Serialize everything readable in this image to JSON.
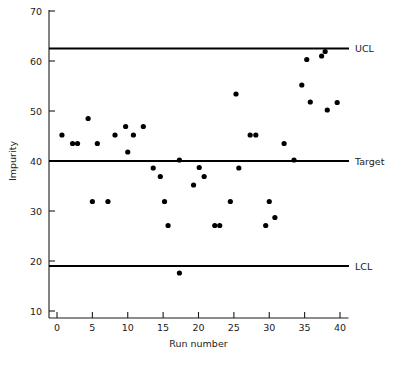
{
  "chart_data": {
    "type": "scatter",
    "title": "",
    "xlabel": "Run number",
    "ylabel": "Impurity",
    "xlim": [
      -1.5,
      41.5
    ],
    "ylim": [
      6.5,
      70
    ],
    "xticks": [
      0,
      5,
      10,
      15,
      20,
      25,
      30,
      35,
      40
    ],
    "yticks": [
      10,
      20,
      30,
      40,
      50,
      60,
      70
    ],
    "grid": false,
    "legend": "none",
    "reference_lines": [
      {
        "name": "UCL",
        "label": "UCL",
        "value": 62.5
      },
      {
        "name": "Target",
        "label": "Target",
        "value": 40.0
      },
      {
        "name": "LCL",
        "label": "LCL",
        "value": 19.0
      }
    ],
    "series": [
      {
        "name": "Impurity",
        "marker": "filled-circle",
        "color": "#000000",
        "points": [
          {
            "x": 0.7,
            "y": 45.2
          },
          {
            "x": 2.2,
            "y": 43.5
          },
          {
            "x": 2.9,
            "y": 43.5
          },
          {
            "x": 4.4,
            "y": 48.5
          },
          {
            "x": 5.0,
            "y": 31.9
          },
          {
            "x": 5.7,
            "y": 43.5
          },
          {
            "x": 7.2,
            "y": 31.9
          },
          {
            "x": 8.2,
            "y": 45.2
          },
          {
            "x": 9.7,
            "y": 46.9
          },
          {
            "x": 10.0,
            "y": 41.8
          },
          {
            "x": 10.8,
            "y": 45.2
          },
          {
            "x": 12.2,
            "y": 46.9
          },
          {
            "x": 13.6,
            "y": 38.6
          },
          {
            "x": 14.6,
            "y": 36.9
          },
          {
            "x": 15.2,
            "y": 31.9
          },
          {
            "x": 15.7,
            "y": 27.1
          },
          {
            "x": 17.3,
            "y": 40.2
          },
          {
            "x": 17.3,
            "y": 17.6
          },
          {
            "x": 19.3,
            "y": 35.2
          },
          {
            "x": 20.1,
            "y": 38.7
          },
          {
            "x": 20.8,
            "y": 36.9
          },
          {
            "x": 22.3,
            "y": 27.1
          },
          {
            "x": 23.0,
            "y": 27.1
          },
          {
            "x": 24.5,
            "y": 31.9
          },
          {
            "x": 25.3,
            "y": 53.4
          },
          {
            "x": 25.7,
            "y": 38.6
          },
          {
            "x": 27.3,
            "y": 45.2
          },
          {
            "x": 28.1,
            "y": 45.2
          },
          {
            "x": 29.5,
            "y": 27.1
          },
          {
            "x": 30.0,
            "y": 31.9
          },
          {
            "x": 30.8,
            "y": 28.7
          },
          {
            "x": 32.1,
            "y": 43.5
          },
          {
            "x": 33.5,
            "y": 40.2
          },
          {
            "x": 34.6,
            "y": 55.2
          },
          {
            "x": 35.3,
            "y": 60.3
          },
          {
            "x": 35.8,
            "y": 51.8
          },
          {
            "x": 37.4,
            "y": 61.0
          },
          {
            "x": 37.9,
            "y": 61.9
          },
          {
            "x": 38.2,
            "y": 50.2
          },
          {
            "x": 39.6,
            "y": 51.7
          }
        ]
      }
    ]
  }
}
